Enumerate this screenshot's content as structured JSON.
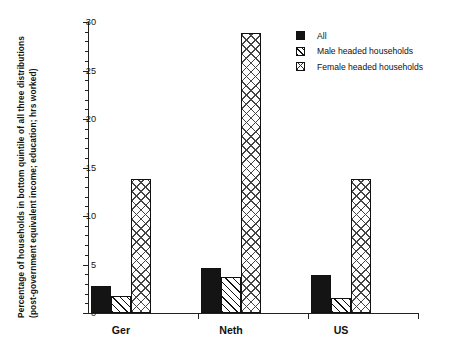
{
  "chart_data": {
    "type": "bar",
    "title": "",
    "subtitle": "",
    "xlabel": "",
    "ylabel": "Percentage of households in bottom quintile of all three distributions (post-government equivalent income; education; hrs worked)",
    "categories": [
      "Ger",
      "Neth",
      "US"
    ],
    "series": [
      {
        "name": "All",
        "pattern": "solid",
        "values": [
          2.8,
          4.6,
          3.9
        ]
      },
      {
        "name": "Male headed households",
        "pattern": "fwd-hatch",
        "values": [
          1.8,
          3.7,
          1.5
        ]
      },
      {
        "name": "Female headed households",
        "pattern": "cross-hatch",
        "values": [
          13.8,
          28.9,
          13.8
        ]
      }
    ],
    "ylim": [
      0,
      30
    ],
    "ytick_labels": [
      "0",
      "5",
      "10",
      "15",
      "20",
      "25",
      "30"
    ],
    "ytick_values": [
      0,
      5,
      10,
      15,
      20,
      25,
      30
    ],
    "yminor_step": 1,
    "grid": false,
    "legend_position": "top-right",
    "colors": {
      "axis": "#222222",
      "series_all": "#141414",
      "series_male": "#ffffff",
      "series_female": "#ffffff",
      "background": "#ffffff"
    }
  },
  "legend": {
    "items": [
      {
        "label": "All"
      },
      {
        "label": "Male headed households"
      },
      {
        "label": "Female headed households"
      }
    ]
  },
  "axes": {
    "y_title": "Percentage of households in bottom quintile of all three distributions (post-government equivalent income; education; hrs worked)"
  }
}
